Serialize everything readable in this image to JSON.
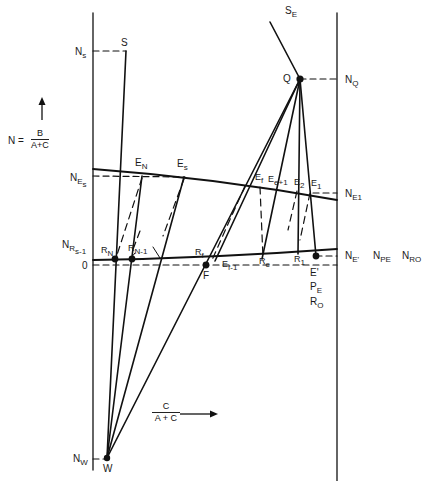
{
  "diagram": {
    "type": "ponchon-savarit-style enthalpy-concentration stage construction",
    "y_axis": {
      "label_prefix": "N =",
      "label_num": "B",
      "label_den": "A+C",
      "arrow": "up-arrow"
    },
    "x_axis": {
      "label_num": "C",
      "label_den": "A + C",
      "arrow": "right-arrow"
    },
    "left_axis_labels": {
      "Ns": {
        "main": "N",
        "sub": "s"
      },
      "NEs": {
        "main": "N",
        "sub": "E",
        "subsub": "s"
      },
      "NRs1": {
        "main": "N",
        "sub": "R",
        "subsub": "s-1"
      },
      "zero": "0",
      "NW": {
        "main": "N",
        "sub": "W"
      }
    },
    "right_axis_labels": {
      "NQ": {
        "main": "N",
        "sub": "Q"
      },
      "NE1": {
        "main": "N",
        "sub": "E",
        "subsub": "1"
      },
      "NEprime": {
        "main": "N",
        "sub": "E'"
      },
      "NPE": {
        "main": "N",
        "sub": "P",
        "subsub": "E"
      },
      "NRO": {
        "main": "N",
        "sub": "RO"
      }
    },
    "points": {
      "S": "S",
      "SE": {
        "main": "S",
        "sub": "E"
      },
      "Q": "Q",
      "W": "W",
      "F": "F",
      "EN": {
        "main": "E",
        "sub": "N"
      },
      "Es": {
        "main": "E",
        "sub": "s"
      },
      "Ef": {
        "main": "E",
        "sub": "f"
      },
      "Ee1": {
        "main": "E",
        "sub": "e+1"
      },
      "E2": {
        "main": "E",
        "sub": "2"
      },
      "E1": {
        "main": "E",
        "sub": "1"
      },
      "RN": {
        "main": "R",
        "sub": "N"
      },
      "RN1": {
        "main": "R",
        "sub": "N-1"
      },
      "Rf": {
        "main": "R",
        "sub": "f"
      },
      "Ef1": {
        "main": "E",
        "sub": "f-1"
      },
      "Re": {
        "main": "R",
        "sub": "e"
      },
      "R1": {
        "main": "R",
        "sub": "1"
      },
      "Eprime": "E'",
      "PE": {
        "main": "P",
        "sub": "E"
      },
      "RO": {
        "main": "R",
        "sub": "O"
      }
    },
    "colors": {
      "line": "#111111",
      "background": "#ffffff"
    }
  }
}
